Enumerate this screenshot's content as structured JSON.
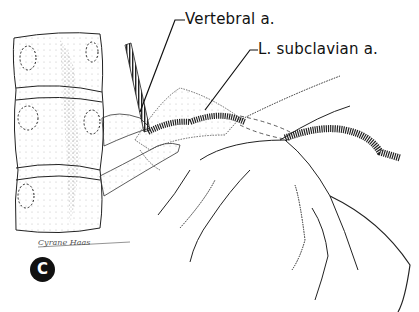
{
  "figure": {
    "panel_letter": "C",
    "labels": {
      "vertebral": "Vertebral a.",
      "subclavian": "L. subclavian a."
    },
    "signature": "Cyrane  Haas",
    "colors": {
      "ink": "#111111",
      "stipple": "#555555",
      "background": "#ffffff"
    }
  }
}
